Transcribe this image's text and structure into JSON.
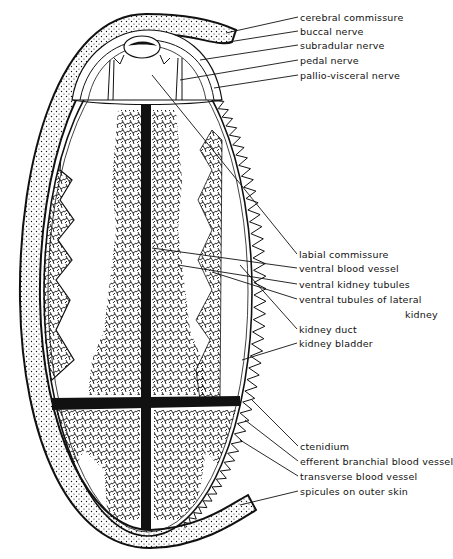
{
  "diagram": {
    "colors": {
      "ink": "#111111",
      "paper": "#ffffff"
    },
    "labels": [
      {
        "id": "cerebral-commissure",
        "text": "cerebral commissure",
        "x": 300,
        "y": 12
      },
      {
        "id": "buccal-nerve",
        "text": "buccal nerve",
        "x": 300,
        "y": 27
      },
      {
        "id": "subradular-nerve",
        "text": "subradular nerve",
        "x": 300,
        "y": 40
      },
      {
        "id": "pedal-nerve",
        "text": "pedal nerve",
        "x": 300,
        "y": 55
      },
      {
        "id": "pallio-visceral-nerve",
        "text": "pallio-visceral nerve",
        "x": 300,
        "y": 70
      },
      {
        "id": "labial-commissure",
        "text": "labial commissure",
        "x": 299,
        "y": 249
      },
      {
        "id": "ventral-blood-vessel",
        "text": "ventral blood vessel",
        "x": 299,
        "y": 263
      },
      {
        "id": "ventral-kidney-tubules",
        "text": "ventral kidney tubules",
        "x": 299,
        "y": 279
      },
      {
        "id": "ventral-tubules-of-lateral-kidney",
        "text": "ventral tubules of lateral",
        "x": 299,
        "y": 294
      },
      {
        "id": "ventral-tubules-of-lateral-kidney-2",
        "text": "kidney",
        "x": 405,
        "y": 309
      },
      {
        "id": "kidney-duct",
        "text": "kidney duct",
        "x": 299,
        "y": 324
      },
      {
        "id": "kidney-bladder",
        "text": "kidney bladder",
        "x": 299,
        "y": 338
      },
      {
        "id": "ctenidium",
        "text": "ctenidium",
        "x": 300,
        "y": 441
      },
      {
        "id": "efferent-branchial-blood-vessel",
        "text": "efferent branchial blood vessel",
        "x": 300,
        "y": 456
      },
      {
        "id": "transverse-blood-vessel",
        "text": "transverse blood vessel",
        "x": 300,
        "y": 471
      },
      {
        "id": "spicules-on-outer-skin",
        "text": "spicules on outer skin",
        "x": 300,
        "y": 486
      }
    ]
  }
}
